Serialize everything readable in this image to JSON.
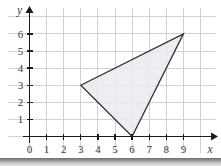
{
  "figure": {
    "background_color": "#ffffff",
    "grid_color": "#d2d2d6",
    "axis_color": "#1b1b1b",
    "bottom_band_color": "#8d8d8f"
  },
  "chart_data": {
    "type": "scatter",
    "title": "",
    "xlabel": "x",
    "ylabel": "y",
    "xlim": [
      0,
      10
    ],
    "ylim": [
      0,
      7
    ],
    "grid": true,
    "legend": "none",
    "x_ticks": [
      0,
      1,
      2,
      3,
      4,
      5,
      6,
      7,
      8,
      9
    ],
    "x_tick_labels": [
      "0",
      "1",
      "2",
      "3",
      "4",
      "5",
      "6",
      "7",
      "8",
      "9"
    ],
    "y_ticks": [
      1,
      2,
      3,
      4,
      5,
      6
    ],
    "y_tick_labels": [
      "1",
      "2",
      "3",
      "4",
      "5",
      "6"
    ],
    "origin_label": "0",
    "shapes": [
      {
        "name": "triangle",
        "kind": "polygon",
        "vertices": [
          [
            3,
            3
          ],
          [
            9,
            6
          ],
          [
            6,
            0
          ]
        ],
        "fill": "#eceaee",
        "stroke": "#2a2a2e"
      }
    ]
  },
  "axes": {
    "x_axis_name": "x",
    "y_axis_name": "y"
  }
}
